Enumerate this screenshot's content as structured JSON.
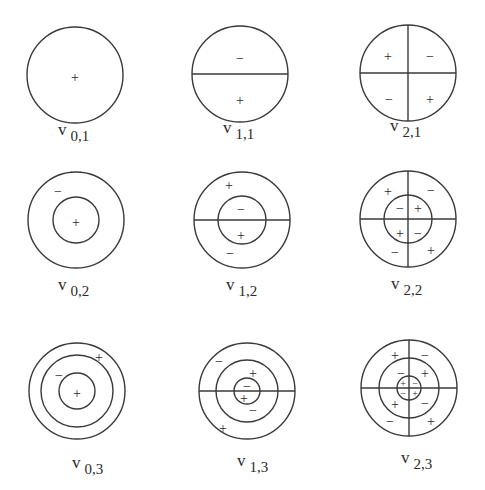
{
  "figure": {
    "type": "membrane-vibration-modes",
    "grid": {
      "rows": 3,
      "cols": 3
    },
    "modes": [
      {
        "label_base": "v",
        "label_sub": "0,1",
        "m": 0,
        "n": 1,
        "cx": 75,
        "cy": 75,
        "rings": [
          48
        ],
        "diameters": 0,
        "signs": [
          {
            "t": "+",
            "x": 75,
            "y": 77
          }
        ]
      },
      {
        "label_base": "v",
        "label_sub": "1,1",
        "m": 1,
        "n": 1,
        "cx": 240,
        "cy": 74,
        "rings": [
          48
        ],
        "diameters": 1,
        "signs": [
          {
            "t": "−",
            "x": 240,
            "y": 58
          },
          {
            "t": "+",
            "x": 240,
            "y": 100
          }
        ]
      },
      {
        "label_base": "v",
        "label_sub": "2,1",
        "m": 2,
        "n": 1,
        "cx": 408,
        "cy": 73,
        "rings": [
          48
        ],
        "diameters": 2,
        "signs": [
          {
            "t": "+",
            "x": 388,
            "y": 56
          },
          {
            "t": "−",
            "x": 430,
            "y": 56
          },
          {
            "t": "−",
            "x": 389,
            "y": 99
          },
          {
            "t": "+",
            "x": 430,
            "y": 99
          }
        ]
      },
      {
        "label_base": "v",
        "label_sub": "0,2",
        "m": 0,
        "n": 2,
        "cx": 76,
        "cy": 220,
        "rings": [
          48,
          23
        ],
        "diameters": 0,
        "signs": [
          {
            "t": "−",
            "x": 58,
            "y": 191
          },
          {
            "t": "+",
            "x": 76,
            "y": 222
          }
        ]
      },
      {
        "label_base": "v",
        "label_sub": "1,2",
        "m": 1,
        "n": 2,
        "cx": 242,
        "cy": 220,
        "rings": [
          48,
          24
        ],
        "diameters": 1,
        "signs": [
          {
            "t": "+",
            "x": 229,
            "y": 185
          },
          {
            "t": "−",
            "x": 241,
            "y": 209
          },
          {
            "t": "+",
            "x": 241,
            "y": 235
          },
          {
            "t": "−",
            "x": 230,
            "y": 253
          }
        ]
      },
      {
        "label_base": "v",
        "label_sub": "2,2",
        "m": 2,
        "n": 2,
        "cx": 408,
        "cy": 219,
        "rings": [
          48,
          24
        ],
        "diameters": 2,
        "signs": [
          {
            "t": "+",
            "x": 388,
            "y": 191
          },
          {
            "t": "−",
            "x": 431,
            "y": 190
          },
          {
            "t": "−",
            "x": 400,
            "y": 208
          },
          {
            "t": "+",
            "x": 418,
            "y": 208
          },
          {
            "t": "+",
            "x": 400,
            "y": 233
          },
          {
            "t": "−",
            "x": 418,
            "y": 233
          },
          {
            "t": "−",
            "x": 395,
            "y": 252
          },
          {
            "t": "+",
            "x": 431,
            "y": 250
          }
        ]
      },
      {
        "label_base": "v",
        "label_sub": "0,3",
        "m": 0,
        "n": 3,
        "cx": 77,
        "cy": 391,
        "rings": [
          48,
          36,
          18
        ],
        "diameters": 0,
        "signs": [
          {
            "t": "+",
            "x": 99,
            "y": 357
          },
          {
            "t": "−",
            "x": 59,
            "y": 375
          },
          {
            "t": "+",
            "x": 77,
            "y": 393
          }
        ]
      },
      {
        "label_base": "v",
        "label_sub": "1,3",
        "m": 1,
        "n": 3,
        "cx": 247,
        "cy": 391,
        "rings": [
          48,
          31,
          13
        ],
        "diameters": 1,
        "signs": [
          {
            "t": "−",
            "x": 219,
            "y": 361
          },
          {
            "t": "+",
            "x": 253,
            "y": 373
          },
          {
            "t": "−",
            "x": 247,
            "y": 386
          },
          {
            "t": "+",
            "x": 244,
            "y": 398
          },
          {
            "t": "−",
            "x": 253,
            "y": 410
          },
          {
            "t": "+",
            "x": 223,
            "y": 428
          }
        ]
      },
      {
        "label_base": "v",
        "label_sub": "2,3",
        "m": 2,
        "n": 3,
        "cx": 409,
        "cy": 388,
        "rings": [
          48,
          30,
          12
        ],
        "diameters": 2,
        "signs": [
          {
            "t": "+",
            "x": 395,
            "y": 355
          },
          {
            "t": "−",
            "x": 425,
            "y": 355
          },
          {
            "t": "−",
            "x": 401,
            "y": 373
          },
          {
            "t": "+",
            "x": 425,
            "y": 373
          },
          {
            "t": "+",
            "x": 403,
            "y": 383,
            "small": true
          },
          {
            "t": "−",
            "x": 415,
            "y": 383,
            "small": true
          },
          {
            "t": "−",
            "x": 403,
            "y": 393,
            "small": true
          },
          {
            "t": "+",
            "x": 415,
            "y": 393,
            "small": true
          },
          {
            "t": "+",
            "x": 395,
            "y": 404
          },
          {
            "t": "−",
            "x": 425,
            "y": 403
          },
          {
            "t": "−",
            "x": 390,
            "y": 421
          },
          {
            "t": "+",
            "x": 431,
            "y": 421
          }
        ]
      }
    ],
    "labels": [
      {
        "base": "v",
        "sub": "0,1",
        "x": 58,
        "y": 135
      },
      {
        "base": "v",
        "sub": "1,1",
        "x": 223,
        "y": 133
      },
      {
        "base": "v",
        "sub": "2,1",
        "x": 390,
        "y": 131
      },
      {
        "base": "v",
        "sub": "0,2",
        "x": 58,
        "y": 290
      },
      {
        "base": "v",
        "sub": "1,2",
        "x": 226,
        "y": 290
      },
      {
        "base": "v",
        "sub": "2,2",
        "x": 391,
        "y": 289
      },
      {
        "base": "v",
        "sub": "0,3",
        "x": 72,
        "y": 468
      },
      {
        "base": "v",
        "sub": "1,3",
        "x": 237,
        "y": 466
      },
      {
        "base": "v",
        "sub": "2,3",
        "x": 401,
        "y": 463
      }
    ],
    "colors": {
      "stroke": "#3a3a3a",
      "text": "#2a2a2a",
      "background": "#ffffff"
    }
  }
}
